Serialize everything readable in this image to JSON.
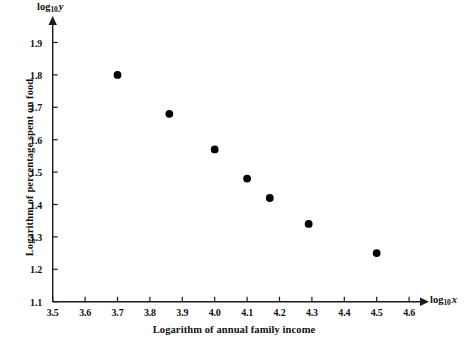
{
  "chart_data": {
    "type": "scatter",
    "title": "",
    "xlabel": "Logarithm of  annual family income",
    "ylabel": "Logarithm of percentage spent on food",
    "x_axis_symbol_base": "log",
    "x_axis_symbol_sub": "10",
    "x_axis_symbol_var": "x",
    "y_axis_symbol_base": "log",
    "y_axis_symbol_sub": "10",
    "y_axis_symbol_var": "y",
    "xlim": [
      3.5,
      4.65
    ],
    "ylim": [
      1.1,
      1.93
    ],
    "grid": false,
    "legend": null,
    "xticks": [
      "3.5",
      "3.6",
      "3.7",
      "3.8",
      "3.9",
      "4.0",
      "4.1",
      "4.2",
      "4.3",
      "4.4",
      "4.5",
      "4.6"
    ],
    "yticks": [
      "1.1",
      "1.2",
      "1.3",
      "1.4",
      "1.5",
      "1.6",
      "1.7",
      "1.8",
      "1.9"
    ],
    "xtick_values": [
      3.5,
      3.6,
      3.7,
      3.8,
      3.9,
      4.0,
      4.1,
      4.2,
      4.3,
      4.4,
      4.5,
      4.6
    ],
    "ytick_values": [
      1.1,
      1.2,
      1.3,
      1.4,
      1.5,
      1.6,
      1.7,
      1.8,
      1.9
    ],
    "x": [
      3.7,
      3.86,
      4.0,
      4.1,
      4.17,
      4.29,
      4.5
    ],
    "y": [
      1.8,
      1.68,
      1.57,
      1.48,
      1.42,
      1.34,
      1.25
    ],
    "points": [
      {
        "x": 3.7,
        "y": 1.8
      },
      {
        "x": 3.86,
        "y": 1.68
      },
      {
        "x": 4.0,
        "y": 1.57
      },
      {
        "x": 4.1,
        "y": 1.48
      },
      {
        "x": 4.17,
        "y": 1.42
      },
      {
        "x": 4.29,
        "y": 1.34
      },
      {
        "x": 4.5,
        "y": 1.25
      }
    ],
    "marker": {
      "shape": "circle",
      "color": "#000000",
      "size": 5
    },
    "axis_color": "#1a1a1a",
    "background_color": "#ffffff"
  }
}
